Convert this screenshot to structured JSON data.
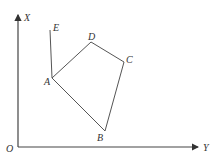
{
  "diagram": {
    "axes": {
      "vertical_label": "X",
      "horizontal_label": "Y",
      "origin_label": "O",
      "color": "#444444"
    },
    "points": {
      "A": {
        "label": "A",
        "x": 52,
        "y": 78
      },
      "B": {
        "label": "B",
        "x": 105,
        "y": 131
      },
      "C": {
        "label": "C",
        "x": 124,
        "y": 62
      },
      "D": {
        "label": "D",
        "x": 91,
        "y": 42
      },
      "E": {
        "label": "E",
        "x": 50,
        "y": 30
      }
    },
    "segments": [
      "E-A",
      "A-B",
      "B-C",
      "C-D",
      "D-A"
    ],
    "line_color": "#555555"
  }
}
